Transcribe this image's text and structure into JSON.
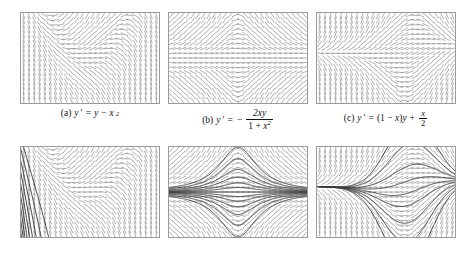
{
  "figure": {
    "kind": "direction-field-figure",
    "rows": 2,
    "columns": 3,
    "stroke_color": "#6e6e6e",
    "curve_color": "#3a3a3a",
    "border_color": "#9a9a9a",
    "background_color": "#ffffff",
    "top_row_description": "direction fields only",
    "bottom_row_description": "direction fields with solution curves"
  },
  "panels": [
    {
      "id": "a",
      "label": "(a)",
      "equation_text": "y' = y - x^2",
      "ode": "y - x*x",
      "xmin": -3,
      "xmax": 3,
      "ymin": -3,
      "ymax": 3,
      "nx": 26,
      "ny": 19,
      "initial_values": [
        -2.8,
        -2.0,
        -1.2,
        -0.4,
        0.4,
        1.2,
        2.0,
        2.8,
        3.6
      ],
      "seed_x": -3,
      "caption": {
        "parts": [
          "(a)",
          "y",
          "′",
          "=",
          "y",
          "−",
          "x",
          "2"
        ]
      }
    },
    {
      "id": "b",
      "label": "(b)",
      "equation_text": "y' = - 2xy / (1 + x^2)",
      "ode": "-2*x*y/(1+x*x)",
      "xmin": -3,
      "xmax": 3,
      "ymin": -3,
      "ymax": 3,
      "nx": 26,
      "ny": 19,
      "initial_values": [
        -3.0,
        -2.2,
        -1.5,
        -1.0,
        -0.6,
        -0.3,
        0,
        0.3,
        0.6,
        1.0,
        1.5,
        2.2,
        3.0
      ],
      "seed_x": 0,
      "caption": {
        "numerator": "2xy",
        "denominator": "1 + x2"
      }
    },
    {
      "id": "c",
      "label": "(c)",
      "equation_text": "y' = (1 - x)y + x/2",
      "ode": "(1-x)*y + x/2",
      "xmin": -3,
      "xmax": 3,
      "ymin": -3,
      "ymax": 3,
      "nx": 26,
      "ny": 19,
      "initial_values": [
        -3.2,
        -2.2,
        -1.4,
        -0.7,
        -0.2,
        0.3,
        0.9,
        1.8,
        2.8
      ],
      "seed_x": 0,
      "caption": {
        "numerator": "x",
        "denominator": "2"
      }
    }
  ],
  "captions": {
    "a": "(a)  y′ = y − x²",
    "b": "(b)  y′ = − 2xy / (1 + x²)",
    "c": "(c)  y′ = (1 − x)y + x/2"
  },
  "layout": {
    "panel_width": 140,
    "panel_height": 92,
    "top_row_y": 12,
    "bottom_row_y": 146,
    "caption_y": 115,
    "column_x": [
      20,
      168,
      316
    ]
  }
}
